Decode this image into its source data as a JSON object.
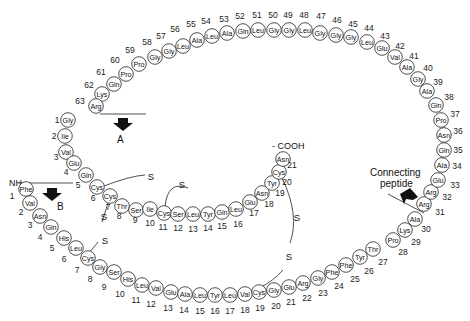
{
  "labels": {
    "chain_a": "A",
    "chain_b": "B",
    "nh2": "NH₂ -",
    "cooh": "- COOH",
    "connecting_peptide_line1": "Connecting",
    "connecting_peptide_line2": "peptide",
    "sulfur": "S"
  },
  "chains": {
    "A": [
      {
        "n": "1",
        "aa": "Gly",
        "x": 68,
        "y": 120,
        "lx": 57,
        "ly": 120
      },
      {
        "n": "2",
        "aa": "Ile",
        "x": 65,
        "y": 136,
        "lx": 54,
        "ly": 136
      },
      {
        "n": "3",
        "aa": "Val",
        "x": 66,
        "y": 152,
        "lx": 56,
        "ly": 157
      },
      {
        "n": "4",
        "aa": "Glu",
        "x": 74,
        "y": 163,
        "lx": 66,
        "ly": 172
      },
      {
        "n": "5",
        "aa": "Gln",
        "x": 86,
        "y": 175,
        "lx": 78,
        "ly": 185
      },
      {
        "n": "6",
        "aa": "Cys",
        "x": 97,
        "y": 187,
        "lx": 93,
        "ly": 198
      },
      {
        "n": "7",
        "aa": "Cys",
        "x": 110,
        "y": 196,
        "lx": 108,
        "ly": 207
      },
      {
        "n": "8",
        "aa": "Thr",
        "x": 122,
        "y": 206,
        "lx": 119,
        "ly": 216
      },
      {
        "n": "9",
        "aa": "Ser",
        "x": 136,
        "y": 210,
        "lx": 135,
        "ly": 220
      },
      {
        "n": "10",
        "aa": "Ile",
        "x": 150,
        "y": 209,
        "lx": 150,
        "ly": 223
      },
      {
        "n": "11",
        "aa": "Cys",
        "x": 164,
        "y": 213,
        "lx": 163,
        "ly": 227
      },
      {
        "n": "12",
        "aa": "Ser",
        "x": 178,
        "y": 214,
        "lx": 178,
        "ly": 228
      },
      {
        "n": "13",
        "aa": "Leu",
        "x": 193,
        "y": 214,
        "lx": 193,
        "ly": 229
      },
      {
        "n": "14",
        "aa": "Tyr",
        "x": 208,
        "y": 214,
        "lx": 208,
        "ly": 228
      },
      {
        "n": "15",
        "aa": "Gln",
        "x": 222,
        "y": 212,
        "lx": 222,
        "ly": 226
      },
      {
        "n": "16",
        "aa": "Leu",
        "x": 236,
        "y": 209,
        "lx": 238,
        "ly": 224
      },
      {
        "n": "17",
        "aa": "Glu",
        "x": 250,
        "y": 202,
        "lx": 254,
        "ly": 213
      },
      {
        "n": "18",
        "aa": "Asn",
        "x": 262,
        "y": 193,
        "lx": 269,
        "ly": 204
      },
      {
        "n": "19",
        "aa": "Tyr",
        "x": 272,
        "y": 183,
        "lx": 280,
        "ly": 193
      },
      {
        "n": "20",
        "aa": "Cys",
        "x": 279,
        "y": 172,
        "lx": 287,
        "ly": 182
      },
      {
        "n": "21",
        "aa": "Asn",
        "x": 283,
        "y": 159,
        "lx": 292,
        "ly": 165
      }
    ],
    "B": [
      {
        "n": "1",
        "aa": "Phe",
        "x": 26,
        "y": 189,
        "lx": 12,
        "ly": 196
      },
      {
        "n": "2",
        "aa": "Val",
        "x": 30,
        "y": 203,
        "lx": 21,
        "ly": 212
      },
      {
        "n": "3",
        "aa": "Asn",
        "x": 40,
        "y": 216,
        "lx": 30,
        "ly": 225
      },
      {
        "n": "4",
        "aa": "Gln",
        "x": 51,
        "y": 227,
        "lx": 40,
        "ly": 237
      },
      {
        "n": "5",
        "aa": "His",
        "x": 64,
        "y": 238,
        "lx": 52,
        "ly": 248
      },
      {
        "n": "6",
        "aa": "Leu",
        "x": 76,
        "y": 248,
        "lx": 64,
        "ly": 259
      },
      {
        "n": "7",
        "aa": "Cys",
        "x": 88,
        "y": 258,
        "lx": 77,
        "ly": 270
      },
      {
        "n": "8",
        "aa": "Gly",
        "x": 100,
        "y": 267,
        "lx": 90,
        "ly": 279
      },
      {
        "n": "9",
        "aa": "Ser",
        "x": 114,
        "y": 272,
        "lx": 104,
        "ly": 287
      },
      {
        "n": "10",
        "aa": "His",
        "x": 128,
        "y": 279,
        "lx": 120,
        "ly": 294
      },
      {
        "n": "11",
        "aa": "Leu",
        "x": 142,
        "y": 285,
        "lx": 136,
        "ly": 300
      },
      {
        "n": "12",
        "aa": "Val",
        "x": 156,
        "y": 288,
        "lx": 151,
        "ly": 304
      },
      {
        "n": "13",
        "aa": "Glu",
        "x": 171,
        "y": 292,
        "lx": 168,
        "ly": 308
      },
      {
        "n": "14",
        "aa": "Ala",
        "x": 185,
        "y": 294,
        "lx": 184,
        "ly": 310
      },
      {
        "n": "15",
        "aa": "Leu",
        "x": 200,
        "y": 295,
        "lx": 200,
        "ly": 311
      },
      {
        "n": "16",
        "aa": "Tyr",
        "x": 215,
        "y": 295,
        "lx": 215,
        "ly": 311
      },
      {
        "n": "17",
        "aa": "Leu",
        "x": 230,
        "y": 295,
        "lx": 230,
        "ly": 311
      },
      {
        "n": "18",
        "aa": "Val",
        "x": 245,
        "y": 294,
        "lx": 245,
        "ly": 310
      },
      {
        "n": "19",
        "aa": "Cys",
        "x": 259,
        "y": 292,
        "lx": 260,
        "ly": 308
      },
      {
        "n": "20",
        "aa": "Gly",
        "x": 274,
        "y": 290,
        "lx": 276,
        "ly": 306
      },
      {
        "n": "21",
        "aa": "Glu",
        "x": 289,
        "y": 287,
        "lx": 291,
        "ly": 302
      },
      {
        "n": "22",
        "aa": "Arg",
        "x": 303,
        "y": 283,
        "lx": 307,
        "ly": 298
      },
      {
        "n": "23",
        "aa": "Gly",
        "x": 318,
        "y": 278,
        "lx": 323,
        "ly": 293
      },
      {
        "n": "24",
        "aa": "Phe",
        "x": 332,
        "y": 272,
        "lx": 339,
        "ly": 286
      },
      {
        "n": "25",
        "aa": "Phe",
        "x": 346,
        "y": 265,
        "lx": 355,
        "ly": 279
      },
      {
        "n": "26",
        "aa": "Tyr",
        "x": 360,
        "y": 257,
        "lx": 369,
        "ly": 271
      },
      {
        "n": "27",
        "aa": "Thr",
        "x": 373,
        "y": 249,
        "lx": 383,
        "ly": 262
      },
      {
        "n": "28",
        "aa": "Pro",
        "x": 393,
        "y": 240,
        "lx": 403,
        "ly": 252
      },
      {
        "n": "29",
        "aa": "Lys",
        "x": 405,
        "y": 230,
        "lx": 416,
        "ly": 242
      },
      {
        "n": "30",
        "aa": "Ala",
        "x": 415,
        "y": 219,
        "lx": 426,
        "ly": 229
      }
    ],
    "C": [
      {
        "n": "31",
        "aa": "Arg",
        "x": 424,
        "y": 204,
        "lx": 440,
        "ly": 212
      },
      {
        "n": "32",
        "aa": "Arg",
        "x": 431,
        "y": 192,
        "lx": 447,
        "ly": 197
      },
      {
        "n": "33",
        "aa": "Glu",
        "x": 438,
        "y": 180,
        "lx": 455,
        "ly": 185
      },
      {
        "n": "34",
        "aa": "Ala",
        "x": 442,
        "y": 165,
        "lx": 457,
        "ly": 166
      },
      {
        "n": "35",
        "aa": "Gln",
        "x": 444,
        "y": 150,
        "lx": 458,
        "ly": 150
      },
      {
        "n": "36",
        "aa": "Asn",
        "x": 444,
        "y": 135,
        "lx": 458,
        "ly": 131
      },
      {
        "n": "37",
        "aa": "Pro",
        "x": 441,
        "y": 120,
        "lx": 455,
        "ly": 114
      },
      {
        "n": "38",
        "aa": "Gln",
        "x": 436,
        "y": 105,
        "lx": 449,
        "ly": 97
      },
      {
        "n": "39",
        "aa": "Ala",
        "x": 427,
        "y": 91,
        "lx": 438,
        "ly": 82
      },
      {
        "n": "40",
        "aa": "Gly",
        "x": 418,
        "y": 79,
        "lx": 428,
        "ly": 68
      },
      {
        "n": "41",
        "aa": "Ala",
        "x": 407,
        "y": 67,
        "lx": 414,
        "ly": 56
      },
      {
        "n": "42",
        "aa": "Val",
        "x": 395,
        "y": 57,
        "lx": 400,
        "ly": 46
      },
      {
        "n": "43",
        "aa": "Glu",
        "x": 382,
        "y": 48,
        "lx": 385,
        "ly": 36
      },
      {
        "n": "44",
        "aa": "Leu",
        "x": 367,
        "y": 42,
        "lx": 369,
        "ly": 28
      },
      {
        "n": "45",
        "aa": "Gly",
        "x": 351,
        "y": 37,
        "lx": 353,
        "ly": 24
      },
      {
        "n": "46",
        "aa": "Gly",
        "x": 336,
        "y": 35,
        "lx": 337,
        "ly": 20
      },
      {
        "n": "47",
        "aa": "Gly",
        "x": 320,
        "y": 33,
        "lx": 321,
        "ly": 16
      },
      {
        "n": "48",
        "aa": "Leu",
        "x": 305,
        "y": 30,
        "lx": 304,
        "ly": 15
      },
      {
        "n": "49",
        "aa": "Gly",
        "x": 289,
        "y": 30,
        "lx": 288,
        "ly": 15
      },
      {
        "n": "50",
        "aa": "Gly",
        "x": 274,
        "y": 30,
        "lx": 273,
        "ly": 15
      },
      {
        "n": "51",
        "aa": "Leu",
        "x": 258,
        "y": 30,
        "lx": 257,
        "ly": 15
      },
      {
        "n": "52",
        "aa": "Gln",
        "x": 243,
        "y": 31,
        "lx": 240,
        "ly": 16
      },
      {
        "n": "53",
        "aa": "Ala",
        "x": 227,
        "y": 33,
        "lx": 224,
        "ly": 19
      },
      {
        "n": "54",
        "aa": "Leu",
        "x": 212,
        "y": 36,
        "lx": 206,
        "ly": 21
      },
      {
        "n": "55",
        "aa": "Ala",
        "x": 197,
        "y": 40,
        "lx": 191,
        "ly": 24
      },
      {
        "n": "56",
        "aa": "Leu",
        "x": 183,
        "y": 46,
        "lx": 175,
        "ly": 29
      },
      {
        "n": "57",
        "aa": "Gly",
        "x": 169,
        "y": 51,
        "lx": 161,
        "ly": 36
      },
      {
        "n": "58",
        "aa": "Gly",
        "x": 155,
        "y": 57,
        "lx": 147,
        "ly": 42
      },
      {
        "n": "59",
        "aa": "Pro",
        "x": 139,
        "y": 64,
        "lx": 130,
        "ly": 50
      },
      {
        "n": "60",
        "aa": "Pro",
        "x": 126,
        "y": 74,
        "lx": 115,
        "ly": 60
      },
      {
        "n": "61",
        "aa": "Gln",
        "x": 114,
        "y": 84,
        "lx": 101,
        "ly": 72
      },
      {
        "n": "62",
        "aa": "Lys",
        "x": 102,
        "y": 94,
        "lx": 89,
        "ly": 85
      },
      {
        "n": "63",
        "aa": "Arg",
        "x": 96,
        "y": 106,
        "lx": 80,
        "ly": 101
      }
    ]
  },
  "disulfides": [
    {
      "from": "A6",
      "to": "A11",
      "label": "S - S"
    },
    {
      "from": "A7",
      "to": "B7",
      "label": "S - S"
    },
    {
      "from": "A20",
      "to": "B19",
      "label": "S - S"
    }
  ],
  "colors": {
    "stroke": "#222222",
    "background": "#ffffff",
    "arrow": "#111111"
  }
}
